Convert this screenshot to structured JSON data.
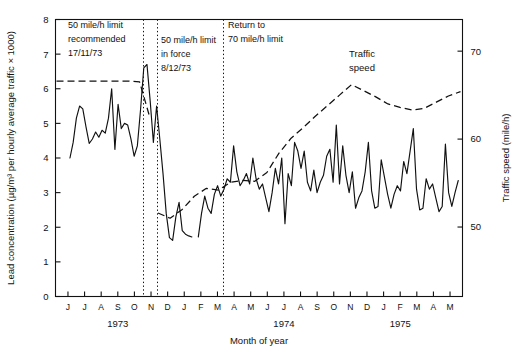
{
  "chart_data": {
    "type": "line",
    "title": "",
    "xlabel": "Month of year",
    "ylabel": "Lead concentration (µg/m³ per hourly average traffic × 1000)",
    "y2label": "Traffic speed (mile/h)",
    "ylim": [
      0,
      8
    ],
    "y2lim": [
      42.1,
      73.6
    ],
    "yticks": [
      0,
      1,
      2,
      3,
      4,
      5,
      6,
      7,
      8
    ],
    "y2ticks": [
      50,
      60,
      70
    ],
    "grid": false,
    "legend_position": "inside-right",
    "x_start": "1973-06",
    "x_end": "1975-05",
    "categories": [
      "J",
      "J",
      "A",
      "S",
      "O",
      "N",
      "D",
      "J",
      "F",
      "M",
      "A",
      "M",
      "J",
      "J",
      "A",
      "S",
      "O",
      "N",
      "D",
      "J",
      "F",
      "M",
      "A",
      "M"
    ],
    "year_labels": [
      {
        "text": "1973",
        "tick_index": 3
      },
      {
        "text": "1974",
        "tick_index": 13
      },
      {
        "text": "1975",
        "tick_index": 20
      }
    ],
    "series": [
      {
        "name": "Lead concentration",
        "style": "solid",
        "axis": "left",
        "units": "µg/m³ per hourly average traffic × 1000",
        "segments": [
          {
            "label": "before 50 mile/h recommendation",
            "values": [
              4.0,
              4.45,
              5.15,
              5.5,
              5.42,
              4.9,
              4.42,
              4.55,
              4.75,
              4.6,
              4.8,
              4.72,
              5.15,
              6.0,
              4.25,
              5.55,
              4.85,
              5.0,
              4.95,
              4.55,
              4.05,
              4.35,
              5.4,
              6.6,
              6.7,
              5.65,
              4.45,
              5.5,
              4.55,
              3.55,
              2.4,
              1.7,
              1.62,
              2.3,
              2.72,
              1.9,
              1.8,
              1.75,
              1.72
            ]
          },
          {
            "label": "after 50 mile/h limit in force",
            "values": [
              1.72,
              2.4,
              2.9,
              2.55,
              2.4,
              2.95,
              3.2,
              2.9,
              3.1,
              3.4,
              3.3,
              4.35,
              3.6,
              3.2,
              3.35,
              3.55,
              3.25,
              4.0,
              3.4,
              3.1,
              3.25,
              2.85,
              2.45,
              3.0,
              3.7,
              3.25,
              4.0,
              2.1,
              3.55,
              3.2,
              4.45,
              4.2,
              3.7,
              4.2,
              3.3,
              3.05,
              3.65,
              3.0,
              3.3,
              3.5,
              4.05,
              4.25,
              3.3,
              4.95,
              3.25,
              4.35,
              3.5,
              3.0,
              3.6,
              2.55,
              2.85,
              3.05,
              3.6,
              4.45,
              3.05,
              2.55,
              2.6,
              3.95,
              3.45,
              2.95,
              2.55,
              2.95,
              3.2,
              3.05,
              3.9,
              3.55,
              4.2,
              4.85,
              3.1,
              2.5,
              2.55,
              3.4,
              3.1,
              3.25,
              2.85,
              2.45,
              2.6,
              4.4,
              3.0,
              2.6,
              3.0,
              3.35
            ]
          }
        ]
      },
      {
        "name": "Traffic speed",
        "style": "dashed",
        "axis": "right",
        "units": "mile/h",
        "segments": [
          {
            "label": "70 mile/h period",
            "values": [
              66.6,
              66.6,
              66.6,
              66.6,
              66.6,
              66.6,
              66.6,
              66.6,
              66.5,
              62.4
            ]
          },
          {
            "label": "50 mile/h period and recovery",
            "values": [
              51.6,
              51.0,
              52.0,
              53.5,
              54.4,
              54.2,
              55.1,
              55.3,
              55.2,
              56.2,
              58.4,
              60.1,
              61.3,
              62.6,
              63.8,
              65.0,
              66.2,
              65.5,
              64.8,
              64.0,
              63.6,
              63.3,
              63.5,
              64.2,
              64.9,
              65.4
            ]
          }
        ]
      }
    ],
    "annotations": [
      {
        "id": "annotation-50-recommended",
        "lines": [
          "50 mile/h limit",
          "recommended",
          "17/11/73"
        ],
        "x_px": 68,
        "y_px": 28
      },
      {
        "id": "annotation-50-in-force",
        "lines": [
          "50 mile/h limit",
          "in force",
          "8/12/73"
        ],
        "x_px": 161,
        "y_px": 43
      },
      {
        "id": "annotation-return-70",
        "lines": [
          "Return to",
          "70 mile/h limit"
        ],
        "x_px": 228,
        "y_px": 28
      },
      {
        "id": "annotation-traffic-speed",
        "lines": [
          "Traffic",
          "speed"
        ],
        "x_px": 362,
        "y_px": 57
      }
    ],
    "event_lines": [
      {
        "id": "event-line-17-11-73",
        "x_px": 143,
        "label": "17/11/73"
      },
      {
        "id": "event-line-8-12-73",
        "x_px": 157,
        "label": "8/12/73"
      },
      {
        "id": "event-line-return-70",
        "x_px": 223,
        "label": "Return to 70 mile/h limit"
      }
    ]
  },
  "axes": {
    "left_title": "Lead concentration (µg/m³ per hourly average traffic × 1000)",
    "right_title": "Traffic speed (mile/h)",
    "bottom_title": "Month of year"
  }
}
